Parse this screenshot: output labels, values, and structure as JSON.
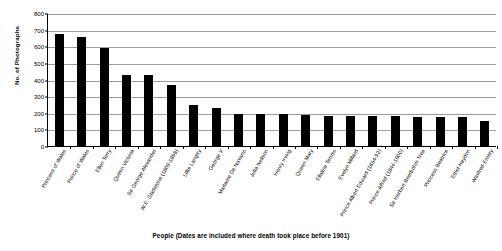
{
  "chart_data": {
    "type": "bar",
    "title": "",
    "xlabel": "People (Dates are included where death took place before 1901)",
    "ylabel": "No. of Photographs",
    "ylim": [
      0,
      800
    ],
    "yticks": [
      0,
      100,
      200,
      300,
      400,
      500,
      600,
      700,
      800
    ],
    "grid": true,
    "legend": "none",
    "orientation": "vertical",
    "bar_color": "#000000",
    "categories": [
      "Princess of Wales",
      "Prince of Wales",
      "Ellen Terry",
      "Queen Victoria",
      "Sir George Alexander",
      "W.E. Gladstone (1809-1898)",
      "Lillie Langtry",
      "George V",
      "Madame De Navarro",
      "Julia Neilson",
      "Henry Irving",
      "Queen Mary",
      "Ellaline Terriss",
      "Evelyn Millard",
      "Prince Albert Edward (1864-92)",
      "Prince Alfred (1844-1900)",
      "Sir Herbert Beerbohm Tree",
      "Princess Beatrice",
      "Ethel Haydon",
      "Winifred Emery"
    ],
    "values": [
      675,
      655,
      590,
      425,
      425,
      365,
      245,
      230,
      195,
      190,
      190,
      185,
      180,
      180,
      180,
      178,
      175,
      175,
      175,
      150
    ]
  }
}
